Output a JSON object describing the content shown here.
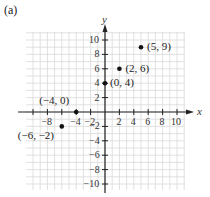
{
  "panel_label": "(a)",
  "chart_data": {
    "type": "scatter",
    "title": "",
    "xlabel": "x",
    "ylabel": "y",
    "xlim": [
      -11,
      11
    ],
    "ylim": [
      -11,
      11
    ],
    "grid": true,
    "x_ticks": [
      -8,
      -6,
      -4,
      -2,
      2,
      4,
      6,
      8,
      10
    ],
    "x_tick_labels": [
      "−8",
      "",
      "−4",
      "−2",
      "2",
      "4",
      "6",
      "8",
      "10"
    ],
    "y_ticks": [
      -10,
      -8,
      -6,
      -4,
      -2,
      2,
      4,
      6,
      8,
      10
    ],
    "y_tick_labels": [
      "−10",
      "−8",
      "−6",
      "−4",
      "−2",
      "2",
      "4",
      "6",
      "8",
      "10"
    ],
    "points": [
      {
        "x": 5,
        "y": 9,
        "label": "(5, 9)"
      },
      {
        "x": 2,
        "y": 6,
        "label": "(2, 6)"
      },
      {
        "x": 0,
        "y": 4,
        "label": "(0, 4)"
      },
      {
        "x": -4,
        "y": 0,
        "label": "(−4, 0)"
      },
      {
        "x": -6,
        "y": -2,
        "label": "(−6, −2)"
      }
    ]
  },
  "colors": {
    "grid": "#d9d9d9",
    "axis": "#222222",
    "point": "#111111"
  }
}
